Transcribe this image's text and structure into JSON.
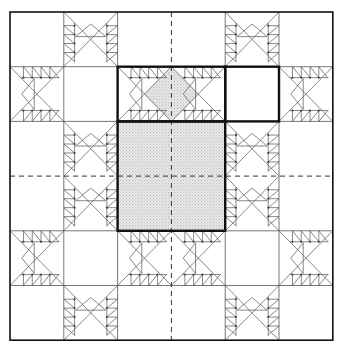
{
  "diagram": {
    "grid": {
      "cols": 6,
      "rows": 6,
      "x0": 10,
      "y0": 12,
      "cell_w": 53.8,
      "cell_h": 54.7
    },
    "colors": {
      "line": "#555555",
      "bold": "#111111",
      "shade": "#e4e4e4",
      "background": "#ffffff"
    },
    "stars": [
      {
        "col": 0,
        "row": 0
      },
      {
        "col": 3,
        "row": 0
      },
      {
        "col": 0,
        "row": 3
      },
      {
        "col": 3,
        "row": 3
      }
    ],
    "center_lines": {
      "style": "dashed",
      "x_col": 3,
      "y_row": 3
    },
    "highlights": [
      {
        "name": "feather-unit-outline",
        "col": 2,
        "row": 1,
        "w": 2,
        "h": 1,
        "shaded_diamond": true
      },
      {
        "name": "small-square-outline",
        "col": 4,
        "row": 1,
        "w": 1,
        "h": 1,
        "shaded": false
      },
      {
        "name": "large-square-outline",
        "col": 2,
        "row": 2,
        "w": 2,
        "h": 2,
        "shaded": true
      }
    ],
    "feather_teeth": 4
  }
}
